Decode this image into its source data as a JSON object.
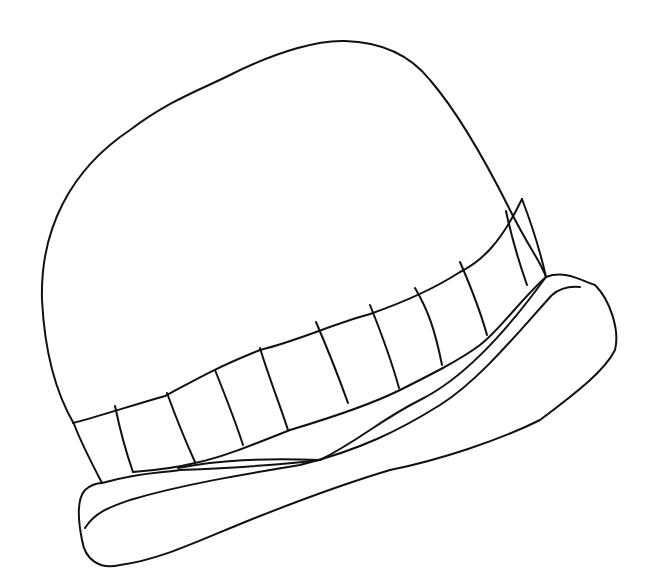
{
  "image": {
    "subject": "hat line drawing",
    "background_color": "#ffffff",
    "line_color": "#111111",
    "parts": [
      "crown",
      "hatband",
      "band-stripes",
      "brim"
    ],
    "band_stripe_count": 10
  }
}
